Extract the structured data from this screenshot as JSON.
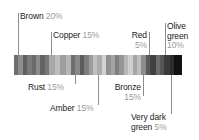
{
  "chart_data": {
    "type": "bar",
    "title": "",
    "subtitle": "",
    "xlabel": "",
    "ylabel": "",
    "orientation": "horizontal-stacked",
    "grid": false,
    "legend_position": "callout-labels",
    "unit": "%",
    "total": 100,
    "categories": [
      "Brown",
      "Rust",
      "Copper",
      "Amber",
      "Bronze",
      "Red",
      "Very dark green",
      "Olive green"
    ],
    "values": [
      20,
      15,
      15,
      15,
      15,
      5,
      5,
      10
    ],
    "annotations": [
      "Brown 20%",
      "Copper 15%",
      "Red 5%",
      "Olive green 10%",
      "Rust 15%",
      "Amber 15%",
      "Bronze 15%",
      "Very dark green 5%"
    ]
  },
  "bar": {
    "name": "colour-proportion-bar",
    "stripes": [
      {
        "color": "#6e6e6e",
        "width": 4
      },
      {
        "color": "#8e8e8e",
        "width": 4
      },
      {
        "color": "#5f5f5f",
        "width": 4
      },
      {
        "color": "#7a7a7a",
        "width": 4
      },
      {
        "color": "#6a6a6a",
        "width": 4
      },
      {
        "color": "#8a8a8a",
        "width": 4
      },
      {
        "color": "#626262",
        "width": 4
      },
      {
        "color": "#787878",
        "width": 4
      },
      {
        "color": "#a8a8a8",
        "width": 5
      },
      {
        "color": "#bcbcbc",
        "width": 5
      },
      {
        "color": "#9e9e9e",
        "width": 5
      },
      {
        "color": "#b4b4b4",
        "width": 5
      },
      {
        "color": "#6e6e6e",
        "width": 4
      },
      {
        "color": "#888888",
        "width": 4
      },
      {
        "color": "#5c5c5c",
        "width": 4
      },
      {
        "color": "#7d7d7d",
        "width": 4
      },
      {
        "color": "#9c9c9c",
        "width": 4
      },
      {
        "color": "#c0c0c0",
        "width": 4
      },
      {
        "color": "#ababab",
        "width": 4
      },
      {
        "color": "#d2d2d2",
        "width": 4
      },
      {
        "color": "#8f8f8f",
        "width": 4
      },
      {
        "color": "#a3a3a3",
        "width": 4
      },
      {
        "color": "#7e7e7e",
        "width": 4
      },
      {
        "color": "#969696",
        "width": 4
      },
      {
        "color": "#b8b8b8",
        "width": 4
      },
      {
        "color": "#cfcfcf",
        "width": 4
      },
      {
        "color": "#a6a6a6",
        "width": 4
      },
      {
        "color": "#bebebe",
        "width": 4
      },
      {
        "color": "#8c8c8c",
        "width": 4
      },
      {
        "color": "#5a5a5a",
        "width": 4
      },
      {
        "color": "#404040",
        "width": 5
      },
      {
        "color": "#6b6b6b",
        "width": 4
      },
      {
        "color": "#555555",
        "width": 4
      },
      {
        "color": "#3a3a3a",
        "width": 5
      },
      {
        "color": "#2c2c2c",
        "width": 4
      },
      {
        "color": "#111111",
        "width": 7
      }
    ]
  },
  "labels": {
    "brown": {
      "name": "Brown",
      "pct": "20%"
    },
    "copper": {
      "name": "Copper",
      "pct": "15%"
    },
    "red": {
      "name": "Red",
      "pct": "5%"
    },
    "olive": {
      "name": "Olive",
      "name2": "green",
      "pct": "10%"
    },
    "rust": {
      "name": "Rust",
      "pct": "15%"
    },
    "amber": {
      "name": "Amber",
      "pct": "15%"
    },
    "bronze": {
      "name": "Bronze",
      "pct": "15%"
    },
    "verydark": {
      "name": "Very dark",
      "name2": "green",
      "pct": "5%"
    }
  }
}
